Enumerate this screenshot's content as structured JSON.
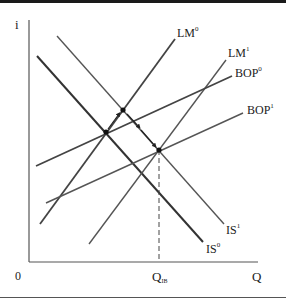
{
  "figure": {
    "axes": {
      "y_label": "i",
      "x_label": "Q",
      "origin_label": "0",
      "x_marker": {
        "base": "Q",
        "sub": "IB"
      }
    },
    "curves": [
      {
        "id": "IS0",
        "base": "IS",
        "sup": "0",
        "color": "#333333",
        "width": 2.0,
        "x1": 37,
        "y1": 56,
        "x2": 203,
        "y2": 242
      },
      {
        "id": "IS1",
        "base": "IS",
        "sup": "1",
        "color": "#555555",
        "width": 1.4,
        "x1": 57,
        "y1": 36,
        "x2": 224,
        "y2": 224
      },
      {
        "id": "LM0",
        "base": "LM",
        "sup": "0",
        "color": "#444444",
        "width": 1.8,
        "x1": 40,
        "y1": 224,
        "x2": 175,
        "y2": 39
      },
      {
        "id": "LM1",
        "base": "LM",
        "sup": "1",
        "color": "#555555",
        "width": 1.4,
        "x1": 89,
        "y1": 244,
        "x2": 226,
        "y2": 60
      },
      {
        "id": "BOP0",
        "base": "BOP",
        "sup": "0",
        "color": "#444444",
        "width": 1.8,
        "x1": 36,
        "y1": 166,
        "x2": 232,
        "y2": 76
      },
      {
        "id": "BOP1",
        "base": "BOP",
        "sup": "1",
        "color": "#555555",
        "width": 1.4,
        "x1": 46,
        "y1": 203,
        "x2": 243,
        "y2": 113
      }
    ],
    "points": [
      {
        "id": "E0",
        "x": 106,
        "y": 132
      },
      {
        "id": "E1",
        "x": 123,
        "y": 110
      },
      {
        "id": "E2",
        "x": 159,
        "y": 150
      }
    ],
    "labels": {
      "LM0": {
        "base": "LM",
        "sup": "0"
      },
      "LM1": {
        "base": "LM",
        "sup": "1"
      },
      "BOP0": {
        "base": "BOP",
        "sup": "0"
      },
      "BOP1": {
        "base": "BOP",
        "sup": "1"
      },
      "IS1": {
        "base": "IS",
        "sup": "1"
      },
      "IS0": {
        "base": "IS",
        "sup": "0"
      }
    }
  }
}
